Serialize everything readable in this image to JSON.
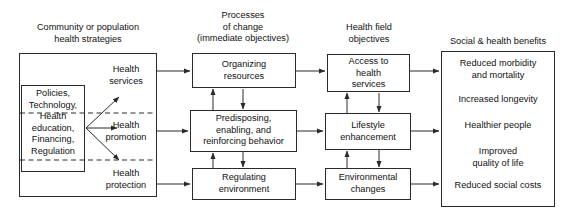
{
  "diagram": {
    "columns": [
      {
        "id": "strategies",
        "heading": "Community or population\nhealth strategies"
      },
      {
        "id": "processes",
        "heading": "Processes\nof change\n(immediate objectives)"
      },
      {
        "id": "objectives",
        "heading": "Health field\nobjectives"
      },
      {
        "id": "benefits",
        "heading": "Social & health benefits"
      }
    ],
    "inputs_box": {
      "text": "Policies,\nTechnology,\nHealth\neducation,\nFinancing,\nRegulation"
    },
    "strategy_labels": [
      {
        "id": "health-services",
        "text": "Health\nservices"
      },
      {
        "id": "health-promotion",
        "text": "Health\npromotion"
      },
      {
        "id": "health-protection",
        "text": "Health\nprotection"
      }
    ],
    "process_boxes": [
      {
        "id": "organizing-resources",
        "text": "Organizing\nresources"
      },
      {
        "id": "predisposing-behavior",
        "text": "Predisposing,\nenabling, and\nreinforcing behavior"
      },
      {
        "id": "regulating-environment",
        "text": "Regulating\nenvironment"
      }
    ],
    "objective_boxes": [
      {
        "id": "access-to-health-services",
        "text": "Access to\nhealth\nservices"
      },
      {
        "id": "lifestyle-enhancement",
        "text": "Lifestyle\nenhancement"
      },
      {
        "id": "environmental-changes",
        "text": "Environmental\nchanges"
      }
    ],
    "benefits": [
      {
        "id": "reduced-morbidity",
        "text": "Reduced morbidity\nand mortality"
      },
      {
        "id": "increased-longevity",
        "text": "Increased longevity"
      },
      {
        "id": "healthier-people",
        "text": "Healthier people"
      },
      {
        "id": "improved-quality-of-life",
        "text": "Improved\nquality of life"
      },
      {
        "id": "reduced-social-costs",
        "text": "Reduced social costs"
      }
    ],
    "colors": {
      "stroke": "#2a2a2a",
      "text": "#111111",
      "background": "#ffffff"
    }
  }
}
